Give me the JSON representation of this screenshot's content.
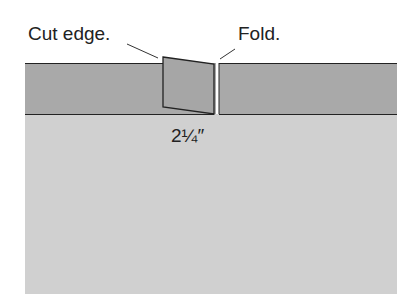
{
  "labels": {
    "cut_edge": "Cut edge.",
    "fold": "Fold.",
    "measurement": "2¼″"
  },
  "colors": {
    "band": "#a9a9a9",
    "fabric": "#d0d0d0",
    "flap": "#a6a6a6",
    "stroke": "#222222"
  }
}
